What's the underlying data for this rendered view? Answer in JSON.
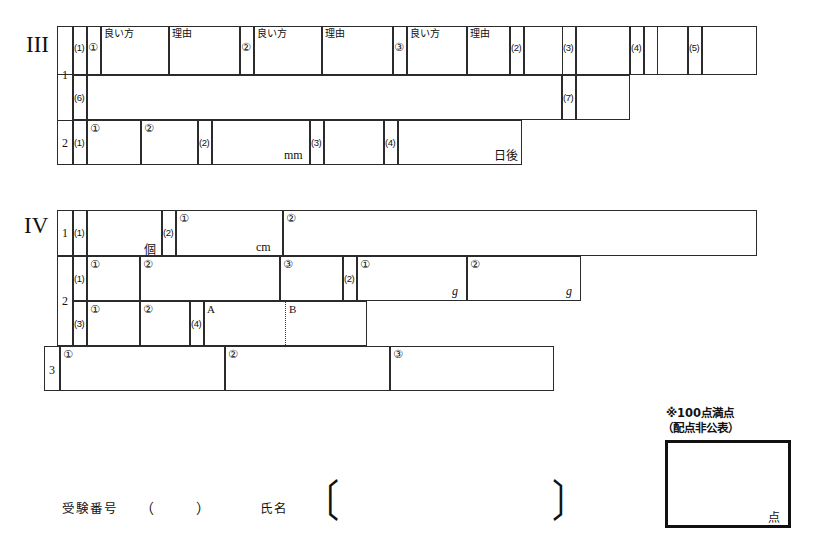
{
  "document": {
    "type": "answer-sheet",
    "sections": [
      {
        "id": "III",
        "roman": "III",
        "rows": [
          {
            "rownum": "1",
            "groups": [
              {
                "paren": "(1)",
                "marks": [
                  "①",
                  "②",
                  "③"
                ],
                "headers": [
                  "良い方",
                  "理由"
                ]
              },
              {
                "paren": "(2)"
              },
              {
                "paren": "(3)"
              },
              {
                "paren": "(4)"
              },
              {
                "paren": "(5)"
              },
              {
                "paren": "(6)"
              },
              {
                "paren": "(7)"
              }
            ]
          },
          {
            "rownum": "2",
            "groups": [
              {
                "paren": "(1)",
                "marks": [
                  "①",
                  "②"
                ]
              },
              {
                "paren": "(2)",
                "unit": "mm"
              },
              {
                "paren": "(3)"
              },
              {
                "paren": "(4)",
                "unit": "日後"
              }
            ]
          }
        ]
      },
      {
        "id": "IV",
        "roman": "IV",
        "rows": [
          {
            "rownum": "1",
            "groups": [
              {
                "paren": "(1)",
                "unit": "個"
              },
              {
                "paren": "(2)",
                "marks": [
                  "①",
                  "②"
                ],
                "unit": "cm"
              }
            ]
          },
          {
            "rownum": "2",
            "groups": [
              {
                "paren": "(1)",
                "marks": [
                  "①",
                  "②",
                  "③"
                ]
              },
              {
                "paren": "(2)",
                "marks": [
                  "①",
                  "②"
                ],
                "unit": "g"
              },
              {
                "paren": "(3)",
                "marks": [
                  "①",
                  "②"
                ]
              },
              {
                "paren": "(4)",
                "labels": [
                  "A",
                  "B"
                ]
              }
            ]
          },
          {
            "rownum": "3",
            "groups": [
              {
                "marks": [
                  "①",
                  "②",
                  "③"
                ]
              }
            ]
          }
        ]
      }
    ]
  },
  "labels": {
    "yoihou": "良い方",
    "riyuu": "理由",
    "mark1": "①",
    "mark2": "②",
    "mark3": "③",
    "p1": "(1)",
    "p2": "(2)",
    "p3": "(3)",
    "p4": "(4)",
    "p5": "(5)",
    "p6": "(6)",
    "p7": "(7)",
    "row1": "1",
    "row2": "2",
    "row3": "3",
    "romanIII": "III",
    "romanIV": "IV",
    "unit_mm": "mm",
    "unit_nichigo": "日後",
    "unit_ko": "個",
    "unit_cm": "cm",
    "unit_g": "g",
    "label_A": "A",
    "label_B": "B"
  },
  "footer": {
    "exam_number_label": "受験番号",
    "exam_number_open": "（",
    "exam_number_close": "）",
    "name_label": "氏名",
    "bracket_open": "〔",
    "bracket_close": "〕"
  },
  "score": {
    "note_line1": "※100点満点",
    "note_line2": "（配点非公表）",
    "unit": "点"
  },
  "colors": {
    "ink": "#1a1a1a",
    "rule": "#2b2b2b",
    "score_border": "#111111",
    "paper": "#ffffff"
  }
}
